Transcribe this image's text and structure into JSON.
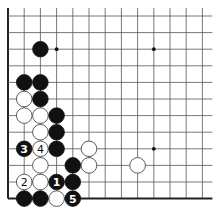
{
  "diagram": {
    "type": "go-board-fragment",
    "corner": "bottom-left",
    "cols": 13,
    "rows": 12,
    "origin": {
      "x": 8,
      "y": 16
    },
    "spacing": {
      "x": 16.2,
      "y": 16.6
    },
    "edges": {
      "left": true,
      "bottom": true,
      "top": false,
      "right": false
    },
    "hoshi": [
      {
        "col": 3,
        "row": 2
      },
      {
        "col": 9,
        "row": 2
      },
      {
        "col": 9,
        "row": 8
      }
    ],
    "stones": [
      {
        "color": "black",
        "col": 2,
        "row": 2,
        "label": ""
      },
      {
        "color": "black",
        "col": 1,
        "row": 4,
        "label": ""
      },
      {
        "color": "black",
        "col": 2,
        "row": 4,
        "label": ""
      },
      {
        "color": "white",
        "col": 1,
        "row": 5,
        "label": ""
      },
      {
        "color": "black",
        "col": 2,
        "row": 5,
        "label": ""
      },
      {
        "color": "white",
        "col": 1,
        "row": 6,
        "label": ""
      },
      {
        "color": "white",
        "col": 2,
        "row": 6,
        "label": ""
      },
      {
        "color": "black",
        "col": 3,
        "row": 6,
        "label": ""
      },
      {
        "color": "white",
        "col": 2,
        "row": 7,
        "label": ""
      },
      {
        "color": "black",
        "col": 3,
        "row": 7,
        "label": ""
      },
      {
        "color": "black",
        "col": 1,
        "row": 8,
        "label": "3"
      },
      {
        "color": "white",
        "col": 2,
        "row": 8,
        "label": "4"
      },
      {
        "color": "black",
        "col": 3,
        "row": 8,
        "label": ""
      },
      {
        "color": "white",
        "col": 5,
        "row": 8,
        "label": ""
      },
      {
        "color": "white",
        "col": 2,
        "row": 9,
        "label": ""
      },
      {
        "color": "black",
        "col": 4,
        "row": 9,
        "label": ""
      },
      {
        "color": "white",
        "col": 5,
        "row": 9,
        "label": ""
      },
      {
        "color": "white",
        "col": 8,
        "row": 9,
        "label": ""
      },
      {
        "color": "white",
        "col": 1,
        "row": 10,
        "label": "2"
      },
      {
        "color": "white",
        "col": 2,
        "row": 10,
        "label": ""
      },
      {
        "color": "black",
        "col": 3,
        "row": 10,
        "label": "1"
      },
      {
        "color": "black",
        "col": 4,
        "row": 10,
        "label": ""
      },
      {
        "color": "black",
        "col": 1,
        "row": 11,
        "label": ""
      },
      {
        "color": "black",
        "col": 2,
        "row": 11,
        "label": ""
      },
      {
        "color": "white",
        "col": 3,
        "row": 11,
        "label": ""
      },
      {
        "color": "black",
        "col": 4,
        "row": 11,
        "label": "5"
      }
    ],
    "colors": {
      "black": "#111111",
      "white": "#ffffff",
      "line": "#555555",
      "edge": "#222222"
    }
  }
}
